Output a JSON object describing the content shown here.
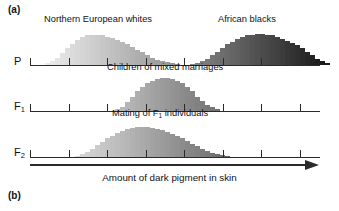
{
  "figure": {
    "panel_a_label": "(a)",
    "panel_b_label": "(b)",
    "axis_title": "Amount of dark pigment in skin",
    "arrow_icon": "right-arrow-icon"
  },
  "rows": [
    {
      "id": "P",
      "generation_label": "P",
      "generation_label_html": "P",
      "captions": [
        {
          "text": "Northern European whites",
          "x": 44
        },
        {
          "text": "African blacks",
          "x": 218
        }
      ]
    },
    {
      "id": "F1",
      "generation_label": "F1",
      "captions": [
        {
          "text": "Children of mixed marriages",
          "x": 107
        }
      ]
    },
    {
      "id": "F2",
      "generation_label": "F2",
      "captions": [
        {
          "text": "Mating of F1 individuals",
          "x": 112
        }
      ]
    }
  ],
  "axis": {
    "ticks": [
      0,
      38.5,
      77,
      115.5,
      154,
      192.5,
      231,
      269.5
    ],
    "tick_count": 8,
    "left_px": 30,
    "width_px": 290
  },
  "chart_data": {
    "type": "bar",
    "title": "Amount of dark pigment in skin",
    "xlabel": "Amount of dark pigment in skin",
    "ylabel": "",
    "grid": false,
    "legend": "none",
    "note": "Three stacked grayscale histograms showing polygenic inheritance of skin pigmentation. Bar fill darkens left-to-right with increasing pigment.",
    "series": [
      {
        "name": "Northern European whites",
        "row": "P",
        "x_start_px": 15,
        "bar_width_px": 5.0,
        "values": [
          2,
          4,
          8,
          13,
          19,
          24,
          28,
          31,
          33,
          34,
          34,
          33,
          31,
          30,
          28,
          26,
          23,
          20,
          17,
          14,
          11,
          8,
          6,
          4,
          3,
          2,
          1
        ]
      },
      {
        "name": "African blacks",
        "row": "P",
        "x_start_px": 160,
        "bar_width_px": 5.0,
        "values": [
          1,
          2,
          4,
          7,
          11,
          15,
          19,
          23,
          26,
          29,
          31,
          33,
          34,
          35,
          35,
          34,
          33,
          31,
          29,
          27,
          25,
          22,
          19,
          15,
          11,
          7,
          4,
          2
        ]
      },
      {
        "name": "Children of mixed marriages",
        "row": "F1",
        "x_start_px": 85,
        "bar_width_px": 5.0,
        "values": [
          2,
          5,
          10,
          16,
          22,
          27,
          31,
          34,
          36,
          37,
          37,
          36,
          34,
          31,
          27,
          22,
          16,
          11,
          7,
          4,
          2
        ]
      },
      {
        "name": "Mating of F1 individuals",
        "row": "F2",
        "x_start_px": 45,
        "bar_width_px": 5.0,
        "values": [
          1,
          3,
          6,
          9,
          13,
          17,
          21,
          24,
          27,
          29,
          31,
          32,
          33,
          33,
          33,
          32,
          31,
          30,
          28,
          26,
          24,
          21,
          18,
          15,
          12,
          9,
          7,
          5,
          3,
          2,
          1
        ]
      }
    ]
  },
  "colors": {
    "axis": "#2b2b2b",
    "text": "#111111",
    "background": "#ffffff",
    "gradient_light": "#f2f2f2",
    "gradient_dark": "#1e1e1e"
  }
}
